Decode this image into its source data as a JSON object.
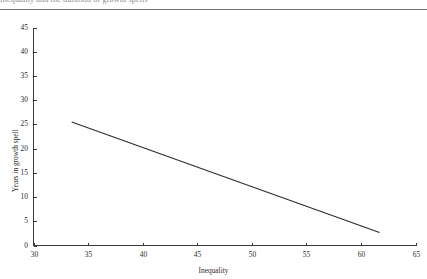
{
  "header": {
    "title_clipped": "Inequality and the duration of growth spells",
    "rule_color": "#6f6f6f"
  },
  "chart_data": {
    "type": "line",
    "title": "",
    "xlabel": "Inequality",
    "ylabel": "Years in growth spell",
    "xlim": [
      30,
      65
    ],
    "ylim": [
      0,
      45
    ],
    "xticks": [
      30,
      35,
      40,
      45,
      50,
      55,
      60,
      65
    ],
    "xtick_labels": [
      "30",
      "35",
      "40",
      "45",
      "50",
      "55",
      "60",
      "65"
    ],
    "yticks": [
      0,
      5,
      10,
      15,
      20,
      25,
      30,
      35,
      40,
      45
    ],
    "ytick_labels": [
      "0",
      "5",
      "10",
      "15",
      "20",
      "25",
      "30",
      "35",
      "40",
      "45"
    ],
    "grid": false,
    "legend": false,
    "line_color": "#2b2b2b",
    "series": [
      {
        "name": "fitted-line",
        "x": [
          33.5,
          61.7
        ],
        "values": [
          25.5,
          2.7
        ]
      }
    ]
  }
}
